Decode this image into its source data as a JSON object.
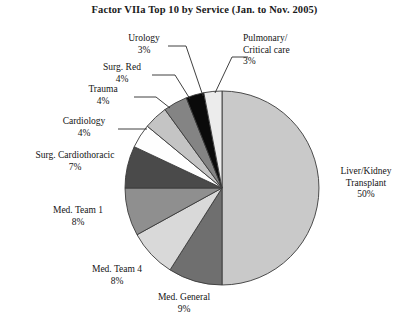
{
  "chart": {
    "title": "Factor VIIa Top 10 by Service (Jan. to Nov. 2005)"
  },
  "chart_data": {
    "type": "pie",
    "title": "Factor VIIa Top 10 by Service (Jan. to Nov. 2005)",
    "xlabel": "",
    "ylabel": "",
    "legend": "none",
    "labels_position": "outside",
    "start_angle_deg": 0,
    "direction": "clockwise",
    "categories": [
      "Liver/Kidney Transplant",
      "Med. General",
      "Med. Team 4",
      "Med. Team 1",
      "Surg. Cardiothoracic",
      "Cardiology",
      "Trauma",
      "Surg. Red",
      "Urology",
      "Pulmonary/Critical care"
    ],
    "values": [
      50,
      9,
      8,
      8,
      7,
      4,
      4,
      4,
      3,
      3
    ],
    "value_labels": [
      "50%",
      "9%",
      "8%",
      "8%",
      "7%",
      "4%",
      "4%",
      "4%",
      "3%",
      "3%"
    ],
    "unit": "percent",
    "colors": [
      "#c9c9c9",
      "#6f6f6f",
      "#d9d9d9",
      "#8f8f8f",
      "#4a4a4a",
      "#fefefe",
      "#c4c4c4",
      "#848484",
      "#0a0a0a",
      "#ececec"
    ],
    "slices": [
      {
        "name": "Liver/Kidney Transplant",
        "value": 50,
        "value_label": "50%",
        "color": "#c9c9c9",
        "label_line1": "Liver/Kidney",
        "label_line2": "Transplant",
        "label_line3": "50%"
      },
      {
        "name": "Med. General",
        "value": 9,
        "value_label": "9%",
        "color": "#6f6f6f",
        "label_line1": "Med. General",
        "label_line2": "9%"
      },
      {
        "name": "Med. Team 4",
        "value": 8,
        "value_label": "8%",
        "color": "#d9d9d9",
        "label_line1": "Med. Team 4",
        "label_line2": "8%"
      },
      {
        "name": "Med. Team 1",
        "value": 8,
        "value_label": "8%",
        "color": "#8f8f8f",
        "label_line1": "Med. Team 1",
        "label_line2": "8%"
      },
      {
        "name": "Surg. Cardiothoracic",
        "value": 7,
        "value_label": "7%",
        "color": "#4a4a4a",
        "label_line1": "Surg. Cardiothoracic",
        "label_line2": "7%"
      },
      {
        "name": "Cardiology",
        "value": 4,
        "value_label": "4%",
        "color": "#fefefe",
        "label_line1": "Cardiology",
        "label_line2": "4%"
      },
      {
        "name": "Trauma",
        "value": 4,
        "value_label": "4%",
        "color": "#c4c4c4",
        "label_line1": "Trauma",
        "label_line2": "4%"
      },
      {
        "name": "Surg. Red",
        "value": 4,
        "value_label": "4%",
        "color": "#848484",
        "label_line1": "Surg. Red",
        "label_line2": "4%"
      },
      {
        "name": "Urology",
        "value": 3,
        "value_label": "3%",
        "color": "#0a0a0a",
        "label_line1": "Urology",
        "label_line2": "3%"
      },
      {
        "name": "Pulmonary/Critical care",
        "value": 3,
        "value_label": "3%",
        "color": "#ececec",
        "label_line1": "Pulmonary/",
        "label_line2": "Critical care",
        "label_line3": "3%"
      }
    ]
  },
  "labels": {
    "pulmonary": {
      "l1": "Pulmonary/",
      "l2": "Critical care",
      "l3": "3%"
    },
    "urology": {
      "l1": "Urology",
      "l2": "3%"
    },
    "surg_red": {
      "l1": "Surg. Red",
      "l2": "4%"
    },
    "trauma": {
      "l1": "Trauma",
      "l2": "4%"
    },
    "cardiology": {
      "l1": "Cardiology",
      "l2": "4%"
    },
    "surg_cardiothoracic": {
      "l1": "Surg. Cardiothoracic",
      "l2": "7%"
    },
    "med_team_1": {
      "l1": "Med. Team 1",
      "l2": "8%"
    },
    "med_team_4": {
      "l1": "Med. Team 4",
      "l2": "8%"
    },
    "med_general": {
      "l1": "Med. General",
      "l2": "9%"
    },
    "liver_kidney": {
      "l1": "Liver/Kidney",
      "l2": "Transplant",
      "l3": "50%"
    }
  }
}
